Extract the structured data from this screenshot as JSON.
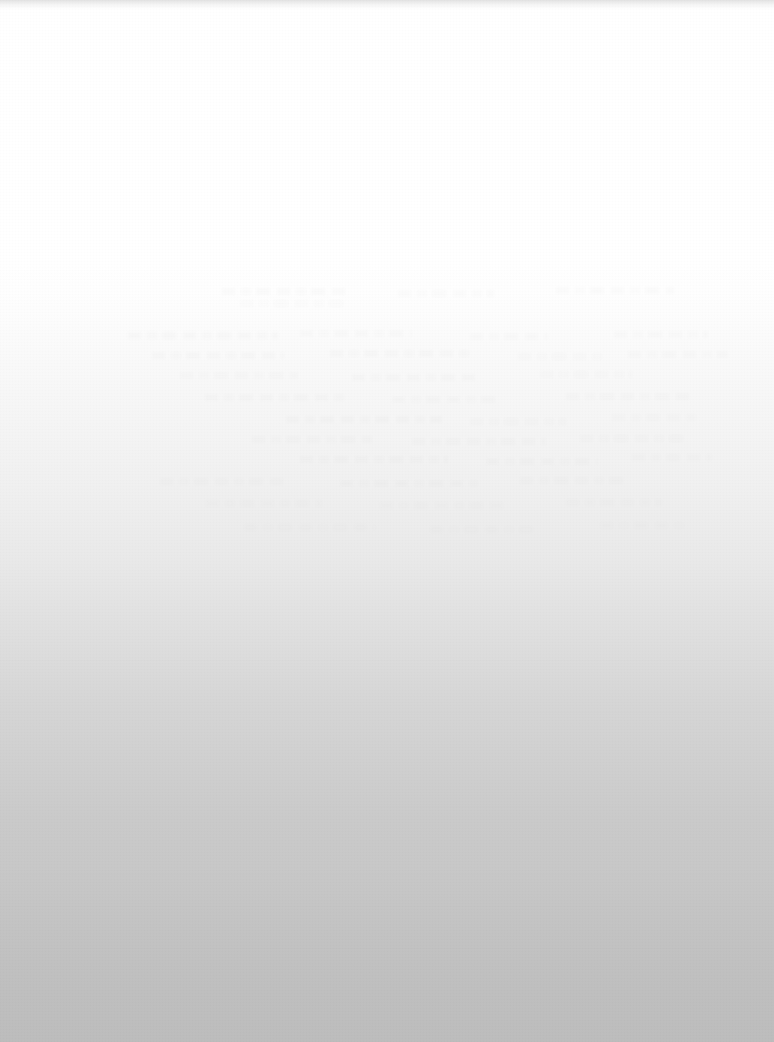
{
  "page": {
    "width": 774,
    "height": 1042,
    "legible_text": "",
    "background_top_color": "#ffffff",
    "background_bottom_color": "#bdbdbd"
  },
  "tone_ramp": {
    "stops": [
      {
        "y": 0,
        "color": "#ffffff"
      },
      {
        "y": 265,
        "color": "#ffffff"
      },
      {
        "y": 310,
        "color": "#fdfdfd"
      },
      {
        "y": 350,
        "color": "#fafafa"
      },
      {
        "y": 420,
        "color": "#f5f5f5"
      },
      {
        "y": 487,
        "color": "#f0f0f0"
      },
      {
        "y": 560,
        "color": "#e9e9e9"
      },
      {
        "y": 610,
        "color": "#e2e2e2"
      },
      {
        "y": 657,
        "color": "#dcdcdc"
      },
      {
        "y": 700,
        "color": "#d6d6d6"
      },
      {
        "y": 760,
        "color": "#d0d0d0"
      },
      {
        "y": 820,
        "color": "#cacaca"
      },
      {
        "y": 866,
        "color": "#c8c8c8"
      },
      {
        "y": 930,
        "color": "#c3c3c3"
      },
      {
        "y": 990,
        "color": "#bfbfbf"
      },
      {
        "y": 1042,
        "color": "#bdbdbd"
      }
    ]
  },
  "top_edge_band": {
    "color": "#919191",
    "height": 9
  },
  "ghost_text_lines": [
    {
      "x": 222,
      "y": 288,
      "width": 128,
      "opacity": 0.3
    },
    {
      "x": 398,
      "y": 290,
      "width": 96,
      "opacity": 0.24
    },
    {
      "x": 556,
      "y": 287,
      "width": 118,
      "opacity": 0.26
    },
    {
      "x": 240,
      "y": 300,
      "width": 104,
      "opacity": 0.22
    },
    {
      "x": 128,
      "y": 332,
      "width": 150,
      "opacity": 0.34
    },
    {
      "x": 300,
      "y": 330,
      "width": 112,
      "opacity": 0.28
    },
    {
      "x": 470,
      "y": 333,
      "width": 78,
      "opacity": 0.24
    },
    {
      "x": 614,
      "y": 331,
      "width": 94,
      "opacity": 0.26
    },
    {
      "x": 152,
      "y": 352,
      "width": 132,
      "opacity": 0.3
    },
    {
      "x": 330,
      "y": 350,
      "width": 144,
      "opacity": 0.3
    },
    {
      "x": 518,
      "y": 353,
      "width": 86,
      "opacity": 0.22
    },
    {
      "x": 628,
      "y": 351,
      "width": 100,
      "opacity": 0.26
    },
    {
      "x": 180,
      "y": 372,
      "width": 118,
      "opacity": 0.26
    },
    {
      "x": 352,
      "y": 374,
      "width": 126,
      "opacity": 0.28
    },
    {
      "x": 540,
      "y": 371,
      "width": 92,
      "opacity": 0.22
    },
    {
      "x": 205,
      "y": 394,
      "width": 140,
      "opacity": 0.28
    },
    {
      "x": 392,
      "y": 396,
      "width": 108,
      "opacity": 0.24
    },
    {
      "x": 566,
      "y": 393,
      "width": 124,
      "opacity": 0.26
    },
    {
      "x": 286,
      "y": 416,
      "width": 156,
      "opacity": 0.3
    },
    {
      "x": 470,
      "y": 418,
      "width": 96,
      "opacity": 0.22
    },
    {
      "x": 612,
      "y": 414,
      "width": 86,
      "opacity": 0.2
    },
    {
      "x": 252,
      "y": 436,
      "width": 120,
      "opacity": 0.26
    },
    {
      "x": 412,
      "y": 438,
      "width": 134,
      "opacity": 0.26
    },
    {
      "x": 580,
      "y": 435,
      "width": 104,
      "opacity": 0.22
    },
    {
      "x": 300,
      "y": 456,
      "width": 148,
      "opacity": 0.28
    },
    {
      "x": 486,
      "y": 458,
      "width": 112,
      "opacity": 0.24
    },
    {
      "x": 632,
      "y": 454,
      "width": 80,
      "opacity": 0.2
    },
    {
      "x": 160,
      "y": 478,
      "width": 126,
      "opacity": 0.22
    },
    {
      "x": 340,
      "y": 480,
      "width": 138,
      "opacity": 0.24
    },
    {
      "x": 520,
      "y": 477,
      "width": 108,
      "opacity": 0.22
    },
    {
      "x": 206,
      "y": 500,
      "width": 116,
      "opacity": 0.2
    },
    {
      "x": 380,
      "y": 502,
      "width": 128,
      "opacity": 0.2
    },
    {
      "x": 566,
      "y": 499,
      "width": 96,
      "opacity": 0.18
    },
    {
      "x": 244,
      "y": 524,
      "width": 132,
      "opacity": 0.16
    },
    {
      "x": 430,
      "y": 526,
      "width": 110,
      "opacity": 0.16
    },
    {
      "x": 600,
      "y": 522,
      "width": 88,
      "opacity": 0.14
    }
  ],
  "scan_streaks": [
    {
      "y": 660,
      "opacity": 0.07
    },
    {
      "y": 712,
      "opacity": 0.06
    },
    {
      "y": 806,
      "opacity": 0.06
    },
    {
      "y": 874,
      "opacity": 0.1
    },
    {
      "y": 882,
      "opacity": 0.08
    },
    {
      "y": 906,
      "opacity": 0.06
    },
    {
      "y": 948,
      "opacity": 0.05
    }
  ]
}
